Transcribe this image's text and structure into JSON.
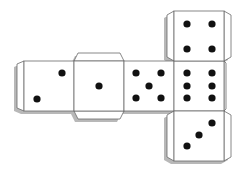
{
  "diagram": {
    "colors": {
      "paper": "#ffffff",
      "outline": "#6a6a6a",
      "shadow": "#b8b8b8",
      "pip": "#111111"
    },
    "faces": [
      {
        "id": "face-two",
        "value": 2,
        "x": 24,
        "y": 61,
        "size": 50,
        "pips": [
          [
            62,
            73
          ],
          [
            37,
            99
          ]
        ]
      },
      {
        "id": "face-one",
        "value": 1,
        "x": 74,
        "y": 61,
        "size": 50,
        "pips": [
          [
            99,
            86
          ]
        ]
      },
      {
        "id": "face-five",
        "value": 5,
        "x": 124,
        "y": 61,
        "size": 50,
        "pips": [
          [
            136,
            73
          ],
          [
            161,
            73
          ],
          [
            149,
            86
          ],
          [
            136,
            98
          ],
          [
            161,
            98
          ]
        ]
      },
      {
        "id": "face-six",
        "value": 6,
        "x": 174,
        "y": 61,
        "size": 50,
        "pips": [
          [
            187,
            73
          ],
          [
            212,
            73
          ],
          [
            187,
            86
          ],
          [
            212,
            86
          ],
          [
            187,
            98
          ],
          [
            212,
            98
          ]
        ]
      },
      {
        "id": "face-four",
        "value": 4,
        "x": 174,
        "y": 11,
        "size": 50,
        "pips": [
          [
            187,
            24
          ],
          [
            212,
            24
          ],
          [
            187,
            49
          ],
          [
            212,
            49
          ]
        ]
      },
      {
        "id": "face-three",
        "value": 3,
        "x": 174,
        "y": 111,
        "size": 50,
        "pips": [
          [
            187,
            146
          ],
          [
            199,
            135
          ],
          [
            212,
            123
          ]
        ]
      }
    ]
  }
}
